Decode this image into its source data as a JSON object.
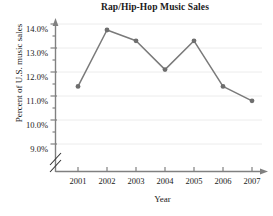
{
  "chart_data": {
    "type": "line",
    "title": "Rap/Hip-Hop Music Sales",
    "xlabel": "Year",
    "ylabel": "Percent of U.S. music sales",
    "categories": [
      "2001",
      "2002",
      "2003",
      "2004",
      "2005",
      "2006",
      "2007"
    ],
    "values": [
      11.4,
      13.75,
      13.3,
      12.1,
      13.3,
      11.4,
      10.8
    ],
    "series": [
      {
        "name": "Percent of U.S. music sales",
        "values": [
          11.4,
          13.75,
          13.3,
          12.1,
          13.3,
          11.4,
          10.8
        ]
      }
    ],
    "ylim": [
      9.0,
      14.0
    ],
    "ytick_labels": [
      "14.0%",
      "13.0%",
      "12.0%",
      "11.0%",
      "10.0%",
      "9.0%"
    ],
    "ytick_values": [
      14.0,
      13.0,
      12.0,
      11.0,
      10.0,
      9.0
    ],
    "yminor_step": 0.5,
    "xtick_labels": [
      "2001",
      "2002",
      "2003",
      "2004",
      "2005",
      "2006",
      "2007"
    ],
    "grid": "horizontal",
    "legend": "none",
    "axis_break": true,
    "axis_break_note": "y-axis broken below 9.0%",
    "marker": "circle",
    "line_color": "#7a7a7a",
    "marker_color": "#6e6e6e",
    "grid_color": "#ececec",
    "axis_color": "#808080",
    "text_color": "#1a1a1a"
  },
  "footer": {
    "cutoff_text": ""
  }
}
